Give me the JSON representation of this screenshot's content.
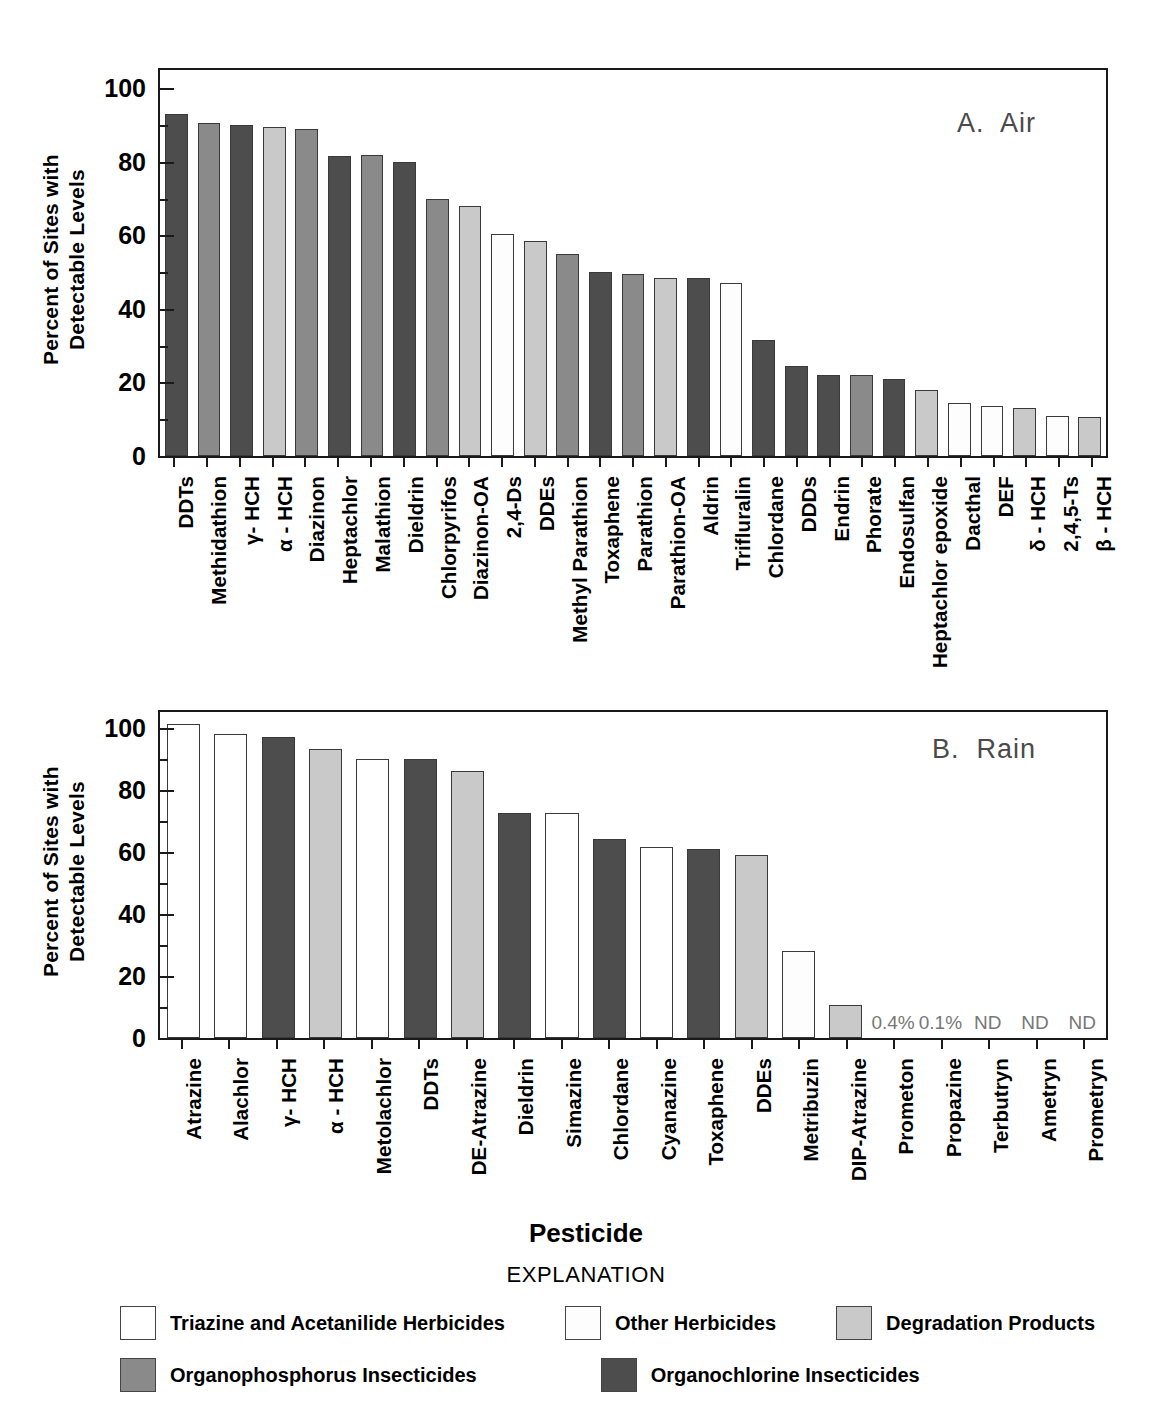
{
  "figure": {
    "ylabel": "Percent of Sites with\nDetectable Levels",
    "xtitle": "Pesticide",
    "explanation_title": "EXPLANATION"
  },
  "legend": {
    "rows": [
      [
        {
          "key": "triazine",
          "label": "Triazine and Acetanilide Herbicides",
          "color": "#ffffff"
        },
        {
          "key": "otherherb",
          "label": "Other Herbicides",
          "color": "#fdfdfd"
        },
        {
          "key": "degrad",
          "label": "Degradation Products",
          "color": "#c9c9c9"
        }
      ],
      [
        {
          "key": "op",
          "label": "Organophosphorus Insecticides",
          "color": "#8a8a8a"
        },
        {
          "key": "oc",
          "label": "Organochlorine Insecticides",
          "color": "#4d4d4d"
        }
      ]
    ]
  },
  "chart_data": [
    {
      "type": "bar",
      "title": "A.  Air",
      "xlabel": "Pesticide",
      "ylabel": "Percent of Sites with Detectable Levels",
      "ylim": [
        0,
        105
      ],
      "yticks": [
        0,
        20,
        40,
        60,
        80,
        100
      ],
      "yticks_minor": [
        10,
        30,
        50,
        70,
        90
      ],
      "grid": false,
      "legend_position": "below-figure",
      "categories": [
        "DDTs",
        "Methidathion",
        "γ- HCH",
        "α - HCH",
        "Diazinon",
        "Heptachlor",
        "Malathion",
        "Dieldrin",
        "Chlorpyrifos",
        "Diazinon-OA",
        "2,4-Ds",
        "DDEs",
        "Methyl Parathion",
        "Toxaphene",
        "Parathion",
        "Parathion-OA",
        "Aldrin",
        "Trifluralin",
        "Chlordane",
        "DDDs",
        "Endrin",
        "Phorate",
        "Endosulfan",
        "Heptachlor epoxide",
        "Dacthal",
        "DEF",
        "δ - HCH",
        "2,4,5-Ts",
        "β - HCH"
      ],
      "values": [
        93,
        90.5,
        90,
        89.5,
        89,
        81.5,
        82,
        80,
        70,
        68,
        60.5,
        58.5,
        55,
        50,
        49.5,
        48.5,
        48.5,
        47,
        31.5,
        24.5,
        22,
        22,
        21,
        18,
        14.5,
        13.5,
        13,
        11,
        10.5
      ],
      "series_class": [
        "oc",
        "op",
        "oc",
        "degrad",
        "op",
        "oc",
        "op",
        "oc",
        "op",
        "degrad",
        "otherherb",
        "degrad",
        "op",
        "oc",
        "op",
        "degrad",
        "oc",
        "otherherb",
        "oc",
        "oc",
        "oc",
        "op",
        "oc",
        "degrad",
        "otherherb",
        "otherherb",
        "degrad",
        "otherherb",
        "degrad"
      ],
      "notes": []
    },
    {
      "type": "bar",
      "title": "B.  Rain",
      "xlabel": "Pesticide",
      "ylabel": "Percent of Sites with Detectable Levels",
      "ylim": [
        0,
        105
      ],
      "yticks": [
        0,
        20,
        40,
        60,
        80,
        100
      ],
      "yticks_minor": [
        10,
        30,
        50,
        70,
        90
      ],
      "grid": false,
      "legend_position": "below-figure",
      "categories": [
        "Atrazine",
        "Alachlor",
        "γ- HCH",
        "α - HCH",
        "Metolachlor",
        "DDTs",
        "DE-Atrazine",
        "Dieldrin",
        "Simazine",
        "Chlordane",
        "Cyanazine",
        "Toxaphene",
        "DDEs",
        "Metribuzin",
        "DIP-Atrazine",
        "Prometon",
        "Propazine",
        "Terbutryn",
        "Ametryn",
        "Prometryn"
      ],
      "values": [
        101,
        98,
        97,
        93,
        90,
        90,
        86,
        72.5,
        72.5,
        64,
        61.5,
        61,
        59,
        28,
        10.5,
        0.4,
        0.1,
        0,
        0,
        0
      ],
      "series_class": [
        "triazine",
        "triazine",
        "oc",
        "degrad",
        "triazine",
        "oc",
        "degrad",
        "oc",
        "triazine",
        "oc",
        "triazine",
        "oc",
        "degrad",
        "otherherb",
        "degrad",
        "triazine",
        "triazine",
        "triazine",
        "triazine",
        "triazine"
      ],
      "notes": [
        {
          "index": 15,
          "text": "0.4%"
        },
        {
          "index": 16,
          "text": "0.1%"
        },
        {
          "index": 17,
          "text": "ND"
        },
        {
          "index": 18,
          "text": "ND"
        },
        {
          "index": 19,
          "text": "ND"
        }
      ]
    }
  ]
}
